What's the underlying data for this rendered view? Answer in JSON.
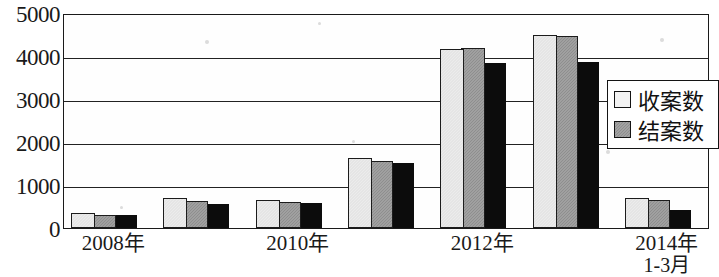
{
  "chart_data": {
    "type": "bar",
    "title": "",
    "xlabel": "",
    "ylabel": "",
    "ylim": [
      0,
      5000
    ],
    "ytick_values": [
      5000,
      4000,
      3000,
      2000,
      1000,
      0
    ],
    "ytick_labels": [
      "5000",
      "4000",
      "3000",
      "2000",
      "1000",
      "0"
    ],
    "grid": true,
    "legend_position": "right",
    "categories": [
      "2008年",
      "",
      "2010年",
      "",
      "2012年",
      "",
      "2014年\n1-3月"
    ],
    "xtick_labels": [
      {
        "main": "2008年",
        "sub": "",
        "group_index": 0
      },
      {
        "main": "2010年",
        "sub": "",
        "group_index": 2
      },
      {
        "main": "2012年",
        "sub": "",
        "group_index": 4
      },
      {
        "main": "2014年",
        "sub": "1-3月",
        "group_index": 6
      }
    ],
    "series": [
      {
        "name": "收案数",
        "color": "#ececec",
        "values": [
          350,
          700,
          660,
          1630,
          4170,
          4480,
          700
        ]
      },
      {
        "name": "结案数",
        "color": "#8e8e8e",
        "values": [
          310,
          630,
          610,
          1560,
          4180,
          4470,
          660
        ]
      },
      {
        "name": "",
        "color": "#0c0c0c",
        "values": [
          300,
          570,
          580,
          1510,
          3830,
          3870,
          420
        ]
      }
    ],
    "legend_entries": [
      {
        "label": "收案数",
        "swatch": "light"
      },
      {
        "label": "结案数",
        "swatch": "gray"
      }
    ]
  }
}
